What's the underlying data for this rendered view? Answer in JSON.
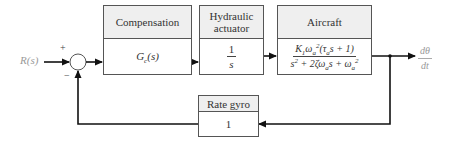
{
  "diagram": {
    "input": {
      "label": "R(s)"
    },
    "summing_junction": {
      "plus": "+",
      "minus": "−"
    },
    "blocks": [
      {
        "id": "compensation",
        "title": "Compensation",
        "transfer": "Gc(s)"
      },
      {
        "id": "hydraulic_actuator",
        "title": "Hydraulic actuator",
        "title_line1": "Hydraulic",
        "title_line2": "actuator",
        "transfer_num": "1",
        "transfer_den": "s"
      },
      {
        "id": "aircraft",
        "title": "Aircraft",
        "transfer_num": "K1ωa²(τa s + 1)",
        "transfer_den": "s² + 2ζωa s + ωa²"
      },
      {
        "id": "rate_gyro",
        "title": "Rate gyro",
        "transfer": "1"
      }
    ],
    "output": {
      "label_num": "dθ",
      "label_den": "dt"
    }
  },
  "colors": {
    "line": "#111111",
    "box_border": "#555555",
    "header_fill": "#efefef",
    "io_label": "#999999"
  }
}
